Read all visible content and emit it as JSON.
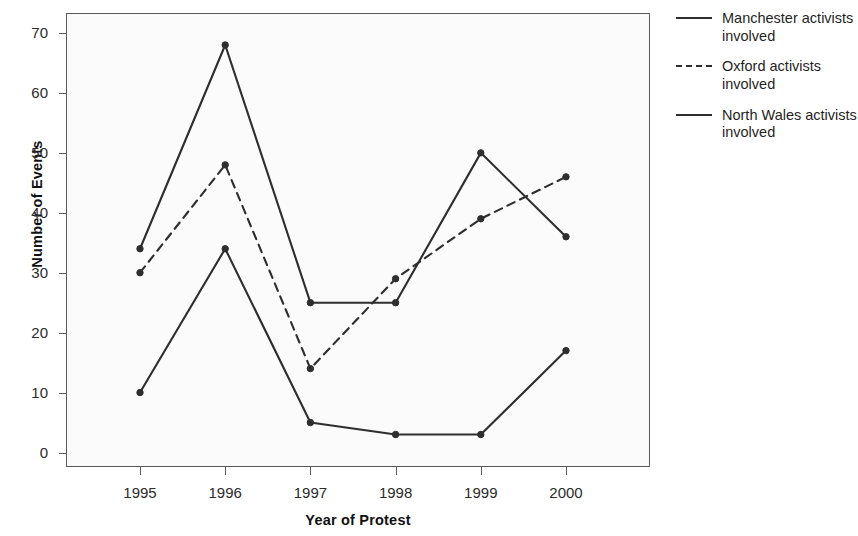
{
  "chart_data": {
    "type": "line",
    "title": "",
    "xlabel": "Year of Protest",
    "ylabel": "Number of Events",
    "categories": [
      "1995",
      "1996",
      "1997",
      "1998",
      "1999",
      "2000"
    ],
    "x": [
      1995,
      1996,
      1997,
      1998,
      1999,
      2000
    ],
    "xlim": [
      1994.5,
      2000.5
    ],
    "ylim": [
      0,
      74
    ],
    "yticks": [
      0,
      10,
      20,
      30,
      40,
      50,
      60,
      70
    ],
    "ytick_labels": [
      "0",
      "10",
      "20",
      "30",
      "40",
      "50",
      "60",
      "70"
    ],
    "grid": false,
    "legend_position": "right",
    "markers": "filled-circle",
    "series": [
      {
        "name": "Manchester activists involved",
        "style": "solid",
        "color": "#2e2e2e",
        "values": [
          34,
          68,
          25,
          25,
          50,
          36
        ]
      },
      {
        "name": "Oxford activists involved",
        "style": "dashed",
        "color": "#2e2e2e",
        "values": [
          30,
          48,
          14,
          29,
          39,
          46
        ]
      },
      {
        "name": "North Wales activists involved",
        "style": "solid",
        "color": "#2e2e2e",
        "values": [
          10,
          34,
          5,
          3,
          3,
          17
        ]
      }
    ]
  },
  "axes": {
    "y_title": "Number of Events",
    "x_title": "Year of Protest",
    "y_tick_labels": [
      "70",
      "60",
      "50",
      "40",
      "30",
      "20",
      "10",
      "0"
    ],
    "x_tick_labels": [
      "1995",
      "1996",
      "1997",
      "1998",
      "1999",
      "2000"
    ]
  },
  "legend": {
    "entries": [
      {
        "label": "Manchester activists involved",
        "style": "solid"
      },
      {
        "label": "Oxford activists involved",
        "style": "dashed"
      },
      {
        "label": "North Wales activists involved",
        "style": "solid"
      }
    ]
  },
  "colors": {
    "line": "#2e2e2e",
    "frame": "#5a5a5a",
    "plot_background": "#fbfbfb",
    "page_background": "#ffffff",
    "text": "#1a1a1a"
  }
}
